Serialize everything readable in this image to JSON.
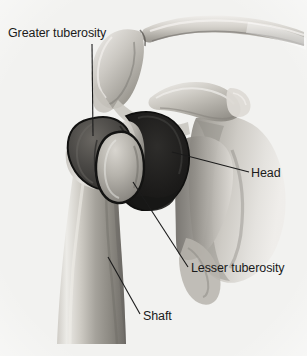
{
  "figure": {
    "kind": "anatomical-illustration",
    "background_color": "#f2f2f0",
    "ink_color": "#1b1b1b"
  },
  "labels": [
    {
      "id": "greater-tuberosity",
      "text": "Greater tuberosity"
    },
    {
      "id": "head",
      "text": "Head"
    },
    {
      "id": "lesser-tuberosity",
      "text": "Lesser tuberosity"
    },
    {
      "id": "shaft",
      "text": "Shaft"
    }
  ],
  "leader_lines": [
    {
      "id": "greater-tuberosity",
      "from": [
        92,
        44
      ],
      "to": [
        93,
        136
      ]
    },
    {
      "id": "head",
      "from": [
        249,
        172
      ],
      "to": [
        172,
        152
      ]
    },
    {
      "id": "lesser-tuberosity",
      "from": [
        188,
        267
      ],
      "to": [
        133,
        182
      ]
    },
    {
      "id": "shaft",
      "from": [
        140,
        314
      ],
      "to": [
        108,
        257
      ]
    }
  ],
  "structures": [
    {
      "id": "clavicle",
      "name": "Clavicle"
    },
    {
      "id": "acromion",
      "name": "Acromion"
    },
    {
      "id": "coracoid-process",
      "name": "Coracoid process"
    },
    {
      "id": "scapula-body",
      "name": "Scapula"
    },
    {
      "id": "humeral-head",
      "name": "Head of humerus"
    },
    {
      "id": "greater-tuberosity",
      "name": "Greater tuberosity"
    },
    {
      "id": "lesser-tuberosity",
      "name": "Lesser tuberosity"
    },
    {
      "id": "humeral-shaft",
      "name": "Shaft of humerus"
    }
  ],
  "palette": {
    "bone_light": "#eceae6",
    "bone_mid": "#b9b6b0",
    "bone_shadow": "#7e7b76",
    "head_dark": "#1f1f1f",
    "tuberosity_dark": "#3a3936",
    "outline": "#151515"
  }
}
